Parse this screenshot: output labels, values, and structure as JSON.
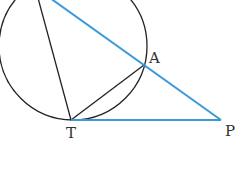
{
  "diagram": {
    "points": {
      "T": {
        "label": "T",
        "x": 71,
        "y": 120
      },
      "A": {
        "label": "A",
        "x": 144,
        "y": 65
      },
      "P": {
        "label": "P",
        "x": 221,
        "y": 120
      }
    },
    "circle": {
      "cx": 73,
      "cy": 46,
      "r": 74
    },
    "colors": {
      "tangent_secant": "#3a9ad9",
      "circle_chords": "#222222",
      "label": "#333333"
    }
  }
}
